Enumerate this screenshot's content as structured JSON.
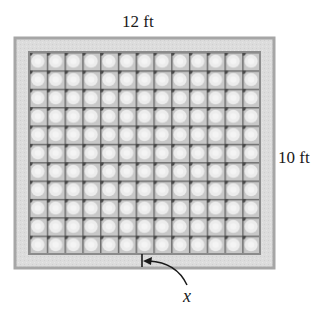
{
  "figure": {
    "labels": {
      "width": "12 ft",
      "height": "10 ft",
      "border_variable": "x"
    },
    "outer_rect": {
      "x": 15,
      "y": 38,
      "width": 259,
      "height": 230
    },
    "inner_rect": {
      "x": 29,
      "y": 52,
      "width": 231,
      "height": 202
    },
    "tile_grid": {
      "columns": 13,
      "rows": 11
    },
    "colors": {
      "border_fill": "#d9d9d9",
      "border_edge": "#a6a6a6",
      "inner_edge": "#8c8c8c",
      "tile_light": "#e6e6e6",
      "tile_dark": "#5a5a5a",
      "text": "#1a1a1a"
    }
  }
}
